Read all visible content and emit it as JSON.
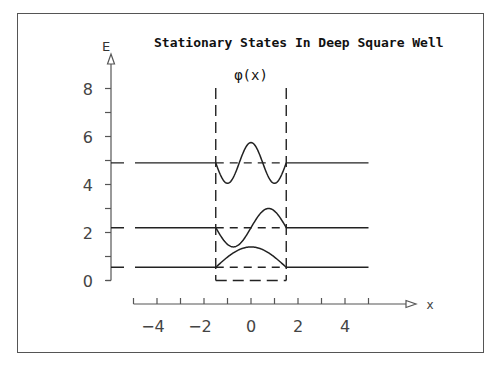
{
  "chart_data": {
    "type": "line",
    "title": "Stationary States In Deep Square Well",
    "xlabel": "x",
    "ylabel": "E",
    "curve_label": "φ(x)",
    "xlim": [
      -5,
      5
    ],
    "ylim": [
      0,
      8
    ],
    "x_ticks": [
      -4,
      -2,
      0,
      2,
      4
    ],
    "x_minor_ticks": [
      -5,
      -3,
      -1,
      1,
      3,
      5
    ],
    "y_ticks": [
      0,
      2,
      4,
      6,
      8
    ],
    "y_minor_ticks": [
      1,
      3,
      5,
      7
    ],
    "grid": false,
    "well": {
      "x_left": -1.5,
      "x_right": 1.5,
      "bottom": 0,
      "style": "dashed"
    },
    "energy_levels": [
      {
        "n": 1,
        "E": 0.55,
        "x_range": [
          -5,
          5
        ]
      },
      {
        "n": 2,
        "E": 2.2,
        "x_range": [
          -5,
          5
        ]
      },
      {
        "n": 3,
        "E": 4.9,
        "x_range": [
          -5,
          5
        ]
      }
    ],
    "series": [
      {
        "name": "n=1",
        "baseline": 0.55,
        "shape": "cos(pi*x/3)",
        "amplitude": 0.85,
        "x_range": [
          -1.5,
          1.5
        ]
      },
      {
        "name": "n=2",
        "baseline": 2.2,
        "shape": "sin(2*pi*x/3)",
        "amplitude": 0.8,
        "x_range": [
          -1.5,
          1.5
        ]
      },
      {
        "name": "n=3",
        "baseline": 4.9,
        "shape": "cos(pi*x)",
        "amplitude": 0.85,
        "x_range": [
          -1.5,
          1.5
        ]
      }
    ]
  },
  "labels": {
    "title": "Stationary States In Deep Square Well",
    "y_axis": "E",
    "x_axis": "x",
    "phi": "φ(x)",
    "x_tick_labels": [
      "−4",
      "−2",
      "0",
      "2",
      "4"
    ],
    "y_tick_labels": [
      "0",
      "2",
      "4",
      "6",
      "8"
    ]
  }
}
